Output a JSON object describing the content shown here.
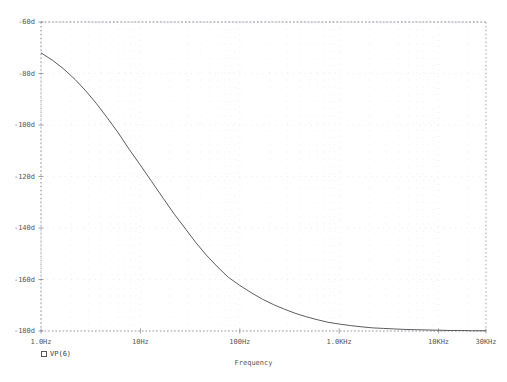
{
  "plot": {
    "x_axis_title": "Frequency",
    "y_axis_ticks": [
      "-60d",
      "-80d",
      "-100d",
      "-120d",
      "-140d",
      "-160d",
      "-180d"
    ],
    "x_axis_ticks": [
      "1.0Hz",
      "10Hz",
      "100Hz",
      "1.0KHz",
      "10KHz",
      "30KHz"
    ],
    "legend": {
      "marker": "square-marker",
      "label": "VP(6)"
    },
    "colors": {
      "curve": "#4a4a4a",
      "grid": "#b9b9c9",
      "minor_grid": "#dcdce8",
      "axis": "#8a8a99",
      "text": "#555555",
      "background": "#ffffff"
    }
  },
  "chart_data": {
    "type": "line",
    "title": "",
    "xlabel": "Frequency",
    "ylabel": "",
    "xscale": "log",
    "xlim": [
      1,
      30000
    ],
    "ylim": [
      -180,
      -60
    ],
    "grid": true,
    "legend_position": "below-axis-left",
    "xticks": [
      1,
      10,
      100,
      1000,
      10000,
      30000
    ],
    "xticklabels": [
      "1.0Hz",
      "10Hz",
      "100Hz",
      "1.0KHz",
      "10KHz",
      "30KHz"
    ],
    "yticks": [
      -60,
      -80,
      -100,
      -120,
      -140,
      -160,
      -180
    ],
    "yticklabels": [
      "-60d",
      "-80d",
      "-100d",
      "-120d",
      "-140d",
      "-160d",
      "-180d"
    ],
    "series": [
      {
        "name": "VP(6)",
        "x": [
          1,
          1.3,
          1.7,
          2.2,
          2.8,
          3.6,
          4.6,
          6.0,
          7.7,
          10,
          13,
          17,
          22,
          28,
          36,
          46,
          60,
          77,
          100,
          130,
          170,
          220,
          280,
          360,
          460,
          600,
          770,
          1000,
          1300,
          1700,
          2200,
          2800,
          3600,
          4600,
          6000,
          7700,
          10000,
          13000,
          17000,
          22000,
          30000
        ],
        "y": [
          -72.0,
          -74.8,
          -78.3,
          -82.3,
          -86.6,
          -91.6,
          -97.0,
          -103.1,
          -109.4,
          -115.6,
          -122.0,
          -128.5,
          -134.7,
          -140.0,
          -145.6,
          -150.5,
          -155.2,
          -159.2,
          -162.3,
          -165.1,
          -167.7,
          -169.8,
          -171.5,
          -173.1,
          -174.4,
          -175.6,
          -176.6,
          -177.3,
          -177.9,
          -178.4,
          -178.8,
          -179.0,
          -179.2,
          -179.4,
          -179.5,
          -179.6,
          -179.7,
          -179.8,
          -179.8,
          -179.9,
          -179.9
        ]
      }
    ]
  }
}
